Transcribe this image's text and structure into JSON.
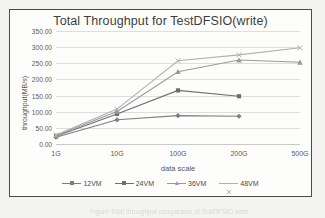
{
  "chart_data": {
    "type": "line",
    "title": "Total Throughput for TestDFSIO(write)",
    "xlabel": "data scale",
    "ylabel": "throughput(MB/s)",
    "categories": [
      "1G",
      "10G",
      "100G",
      "200G",
      "500G"
    ],
    "ylim": [
      0,
      350
    ],
    "ytick_step": 50,
    "ytick_labels": [
      "0.00",
      "50.00",
      "100.00",
      "150.00",
      "200.00",
      "250.00",
      "300.00",
      "350.00"
    ],
    "grid": "horizontal",
    "legend_position": "bottom",
    "series": [
      {
        "name": "12VM",
        "marker": "diamond",
        "color": "#7f7f7f",
        "values": [
          21.0,
          75.0,
          88.0,
          86.0,
          null
        ]
      },
      {
        "name": "24VM",
        "marker": "square",
        "color": "#6e6e6e",
        "values": [
          24.0,
          93.0,
          166.0,
          148.0,
          null
        ]
      },
      {
        "name": "36VM",
        "marker": "triangle",
        "color": "#9a9a9a",
        "values": [
          26.0,
          101.0,
          224.0,
          260.0,
          253.0
        ]
      },
      {
        "name": "48VM",
        "marker": "x",
        "color": "#b0b0b0",
        "values": [
          28.0,
          108.0,
          258.0,
          276.0,
          298.0
        ]
      }
    ]
  },
  "artifact": {
    "caption_fragment": "Figure  Total throughput comparison of TestDFSIO write"
  }
}
